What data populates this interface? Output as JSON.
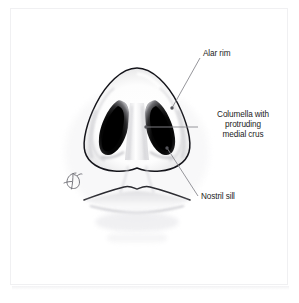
{
  "figure": {
    "domain_type": "anatomical-illustration",
    "view": "basal view of the nose",
    "background_color": "#ffffff",
    "frame_color": "#f0f0f2",
    "ink_color": "#1c1c1c",
    "leader_line_color": "#8a8a90"
  },
  "labels": [
    {
      "id": "alar-rim",
      "text": "Alar rim",
      "lines": [
        "Alar rim"
      ]
    },
    {
      "id": "columella",
      "text": "Columella with protruding medial crus",
      "lines": [
        "Columella with",
        "protruding",
        "medial crus"
      ]
    },
    {
      "id": "nostril-sill",
      "text": "Nostril sill",
      "lines": [
        "Nostril sill"
      ]
    }
  ],
  "columella_label": {
    "line1": "Columella with",
    "line2": "protruding",
    "line3": "medial crus"
  },
  "signature": {
    "name": "artist-monogram",
    "glyph": "ℒ"
  },
  "anatomy_parts": [
    "nasal tip",
    "left nostril",
    "right nostril",
    "columella",
    "alar rim",
    "nostril sill",
    "upper lip",
    "lower lip"
  ]
}
